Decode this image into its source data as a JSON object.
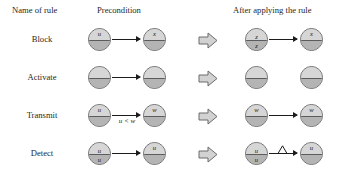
{
  "figure": {
    "columns": {
      "name": "Name of rule",
      "precondition": "Precondition",
      "postcondition": "After applying the rule"
    },
    "separator_icon": "block-arrow-right-icon",
    "colors": {
      "node_top": "#d6d6d6",
      "node_bottom": "#b4b4b4",
      "node_stroke": "#6e6e6e",
      "arrow": "#1c1c1c",
      "text": "#1a1a1a",
      "background": "#ffffff"
    },
    "rows": [
      {
        "name": "Block",
        "precondition": {
          "nodes": [
            {
              "label_mid": "u",
              "label_up": "",
              "label_down": ""
            },
            {
              "label_mid": "x",
              "label_up": "",
              "label_down": ""
            }
          ],
          "arrow": true,
          "arrow_label": "",
          "arrow_broken": false
        },
        "postcondition": {
          "nodes": [
            {
              "label_mid": "",
              "label_up": "z",
              "label_down": "z"
            },
            {
              "label_mid": "x",
              "label_up": "",
              "label_down": ""
            }
          ],
          "arrow": true,
          "arrow_label": "",
          "arrow_broken": false
        }
      },
      {
        "name": "Activate",
        "precondition": {
          "nodes": [
            {
              "label_mid": "",
              "label_up": "",
              "label_down": ""
            },
            {
              "label_mid": "",
              "label_up": "",
              "label_down": ""
            }
          ],
          "arrow": true,
          "arrow_label": "",
          "arrow_broken": false
        },
        "postcondition": {
          "nodes": [
            {
              "label_mid": "",
              "label_up": "",
              "label_down": ""
            },
            {
              "label_mid": "",
              "label_up": "",
              "label_down": ""
            }
          ],
          "arrow": false,
          "arrow_label": "",
          "arrow_broken": false
        }
      },
      {
        "name": "Transmit",
        "precondition": {
          "nodes": [
            {
              "label_mid": "u",
              "label_up": "",
              "label_down": ""
            },
            {
              "label_mid": "w",
              "label_up": "",
              "label_down": ""
            }
          ],
          "arrow": true,
          "arrow_label": "u < w",
          "arrow_broken": false
        },
        "postcondition": {
          "nodes": [
            {
              "label_mid": "w",
              "label_up": "",
              "label_down": ""
            },
            {
              "label_mid": "w",
              "label_up": "",
              "label_down": ""
            }
          ],
          "arrow": true,
          "arrow_label": "",
          "arrow_broken": false
        }
      },
      {
        "name": "Detect",
        "precondition": {
          "nodes": [
            {
              "label_mid": "",
              "label_up": "u",
              "label_down": "u"
            },
            {
              "label_mid": "u",
              "label_up": "",
              "label_down": ""
            }
          ],
          "arrow": true,
          "arrow_label": "",
          "arrow_broken": false
        },
        "postcondition": {
          "nodes": [
            {
              "label_mid": "",
              "label_up": "u",
              "label_down": "u"
            },
            {
              "label_mid": "u",
              "label_up": "",
              "label_down": ""
            }
          ],
          "arrow": true,
          "arrow_label": "",
          "arrow_broken": true
        }
      }
    ]
  }
}
